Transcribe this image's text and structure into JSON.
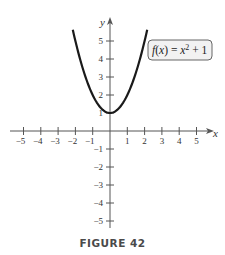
{
  "figure": {
    "caption": "FIGURE 42",
    "function_label": {
      "f": "f",
      "open": "(",
      "x": "x",
      "close": ")",
      "eq": " = ",
      "x2": "x",
      "exp": "2",
      "rest": " + 1"
    },
    "x_axis_label": "x",
    "y_axis_label": "y"
  },
  "colors": {
    "axis": "#555555",
    "curve": "#1a1a1a",
    "label_box_fill": "#f2f2f2",
    "label_box_stroke": "#555555"
  },
  "chart_data": {
    "type": "line",
    "title": "",
    "caption": "FIGURE 42",
    "xlabel": "x",
    "ylabel": "y",
    "xlim": [
      -5.5,
      5.5
    ],
    "ylim": [
      -6,
      6
    ],
    "x_ticks": [
      -5,
      -4,
      -3,
      -2,
      -1,
      1,
      2,
      3,
      4,
      5
    ],
    "y_ticks": [
      -5,
      -4,
      -3,
      -2,
      -1,
      1,
      2,
      3,
      4,
      5
    ],
    "grid": false,
    "series": [
      {
        "name": "f(x) = x^2 + 1",
        "equation": "f(x) = x^2 + 1",
        "x": [
          -2.1,
          -2,
          -1.5,
          -1,
          -0.5,
          0,
          0.5,
          1,
          1.5,
          2,
          2.1
        ],
        "y": [
          5.41,
          5,
          3.25,
          2,
          1.25,
          1,
          1.25,
          2,
          3.25,
          5,
          5.41
        ]
      }
    ],
    "annotations": [
      {
        "text": "f(x) = x^2 + 1",
        "position": "upper right, boxed"
      }
    ]
  }
}
